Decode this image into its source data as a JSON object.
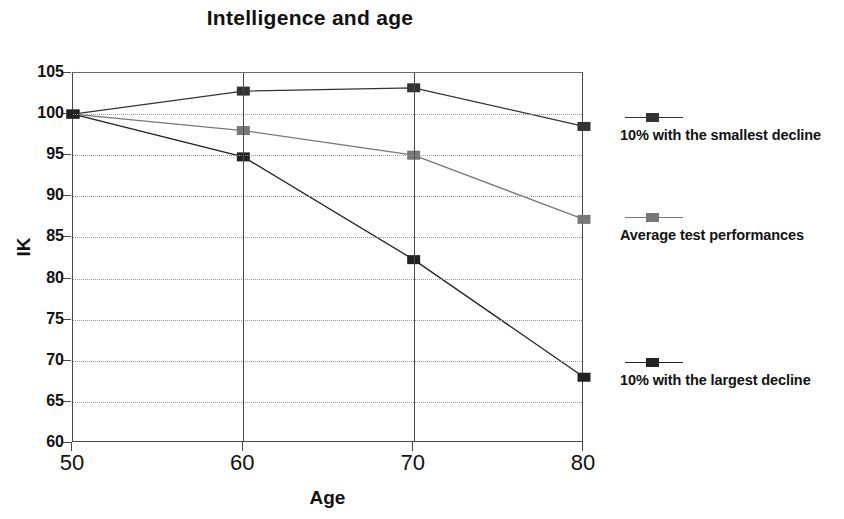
{
  "chart_data": {
    "type": "line",
    "title": "Intelligence and age",
    "xlabel": "Age",
    "ylabel": "IK",
    "x": [
      50,
      60,
      70,
      80
    ],
    "xticklabels": [
      "50",
      "60",
      "70",
      "80"
    ],
    "xlim": [
      50,
      80
    ],
    "ylim": [
      60,
      105
    ],
    "yticks": [
      60,
      65,
      70,
      75,
      80,
      85,
      90,
      95,
      100,
      105
    ],
    "yticklabels": [
      "60",
      "65",
      "70",
      "75",
      "80",
      "85",
      "90",
      "95",
      "100",
      "105"
    ],
    "grid": "horizontal-dotted-plus-vertical-solid",
    "legend_position": "right",
    "series": [
      {
        "name": "10% with the smallest decline",
        "values": [
          100,
          102.8,
          103.2,
          98.5
        ],
        "color": "#333333",
        "marker": "square"
      },
      {
        "name": "Average test performances",
        "values": [
          100,
          98.0,
          95.0,
          87.2
        ],
        "color": "#777777",
        "marker": "square"
      },
      {
        "name": "10% with the largest decline",
        "values": [
          100,
          94.8,
          82.3,
          68.0
        ],
        "color": "#222222",
        "marker": "square"
      }
    ]
  },
  "legend": {
    "entries": [
      {
        "label": "10% with the smallest decline"
      },
      {
        "label": "Average test performances"
      },
      {
        "label": "10% with the largest decline"
      }
    ]
  }
}
